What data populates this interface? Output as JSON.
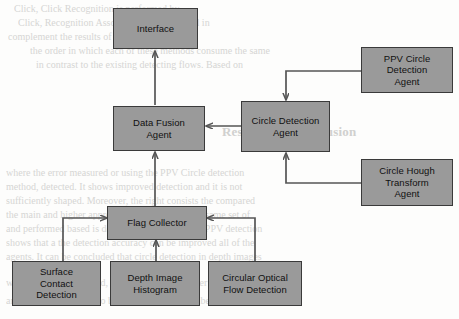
{
  "figure": {
    "node_fill_color": "#9a9a9a",
    "node_border_color": "#3a3a3a",
    "edge_color": "#555555",
    "background_color": "#fdfdfc"
  },
  "nodes": {
    "interface": {
      "label": "Interface"
    },
    "data_fusion_agent": {
      "label": "Data Fusion\nAgent"
    },
    "circle_detection_agent": {
      "label": "Circle Detection\nAgent"
    },
    "ppv_circle_detection_agent": {
      "label": "PPV Circle\nDetection\nAgent"
    },
    "circle_hough_transform_agent": {
      "label": "Circle Hough\nTransform\nAgent"
    },
    "flag_collector": {
      "label": "Flag Collector"
    },
    "surface_contact_detection": {
      "label": "Surface\nContact\nDetection"
    },
    "depth_image_histogram": {
      "label": "Depth Image\nHistogram"
    },
    "circular_optical_flow_detection": {
      "label": "Circular Optical\nFlow Detection"
    }
  },
  "edges": [
    {
      "id": "flag-to-fusion",
      "from": "flag_collector",
      "to": "data_fusion_agent"
    },
    {
      "id": "fusion-to-iface",
      "from": "data_fusion_agent",
      "to": "interface"
    },
    {
      "id": "circle-to-fusion",
      "from": "circle_detection_agent",
      "to": "data_fusion_agent"
    },
    {
      "id": "ppv-to-circle",
      "from": "ppv_circle_detection_agent",
      "to": "circle_detection_agent"
    },
    {
      "id": "hough-to-circle",
      "from": "circle_hough_transform_agent",
      "to": "circle_detection_agent"
    },
    {
      "id": "surface-to-flag",
      "from": "surface_contact_detection",
      "to": "flag_collector"
    },
    {
      "id": "depth-to-flag",
      "from": "depth_image_histogram",
      "to": "flag_collector"
    },
    {
      "id": "optical-to-flag",
      "from": "circular_optical_flow_detection",
      "to": "flag_collector"
    }
  ],
  "background_text": {
    "lines": [
      "Click, Click Recognition is performed by",
      "Click, Recognition Associations are provided in",
      "complement the results of the object detection",
      "the order in which each of these methods consume the same",
      "in contrast to the existing detecting flows. Based on",
      "Results and Conclusion",
      "where the error measured or using the PPV Circle detection",
      "method, detected. It shows improved detection and it is not",
      "sufficiently shaped. Moreover, the right consists the compared",
      "the main and higher approach. It is shown for the same set of",
      "and performed based is described in Table 1. The PPV detection",
      "shows that a the detection accuracy can be improved all of the",
      "agents. It can be concluded that circle detection in depth images",
      "when the hand is applied, it is applied to a number of images",
      "and thus, it is detected to be able to detect a number of images"
    ]
  }
}
